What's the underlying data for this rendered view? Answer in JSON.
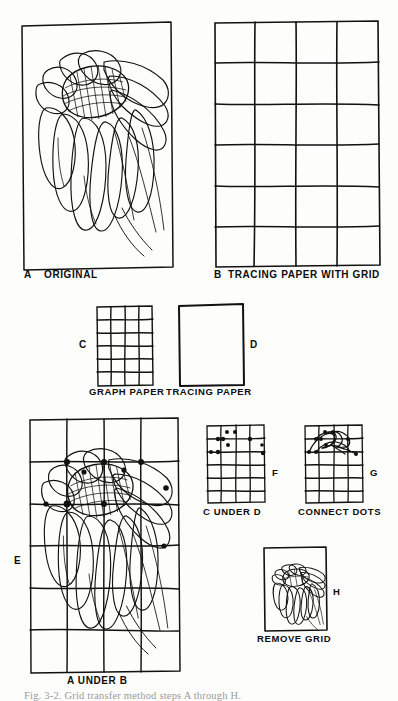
{
  "figure": {
    "ink_color": "#111111",
    "paper_color": "#fdfdfc",
    "bottom_caption": "Fig.  3-2.  Grid  transfer  method  steps  A  through  H."
  },
  "panels": [
    {
      "id": "A",
      "letter": "A",
      "caption": "ORIGINAL",
      "kind": "flower-drawing",
      "note": "Line drawing of a daisy-like flower head with drooping petals inside a hand-drawn rectangle"
    },
    {
      "id": "B",
      "letter": "B",
      "caption": "TRACING PAPER WITH GRID",
      "kind": "grid",
      "columns": 4,
      "rows": 6
    },
    {
      "id": "C",
      "letter": "C",
      "caption": "GRAPH PAPER",
      "kind": "grid",
      "columns": 4,
      "rows": 6
    },
    {
      "id": "D",
      "letter": "D",
      "caption": "TRACING PAPER",
      "kind": "blank-sheet"
    },
    {
      "id": "E",
      "letter": "E",
      "caption": "A UNDER B",
      "kind": "flower-with-grid-and-dots",
      "columns": 4,
      "rows": 6
    },
    {
      "id": "F",
      "letter": "F",
      "caption": "C UNDER D",
      "kind": "grid-with-dots",
      "columns": 4,
      "rows": 6,
      "dot_count": 10
    },
    {
      "id": "G",
      "letter": "G",
      "caption": "CONNECT DOTS",
      "kind": "grid-with-connected-dots",
      "columns": 4,
      "rows": 6
    },
    {
      "id": "H",
      "letter": "H",
      "caption": "REMOVE GRID",
      "kind": "flower-drawing-small"
    }
  ]
}
